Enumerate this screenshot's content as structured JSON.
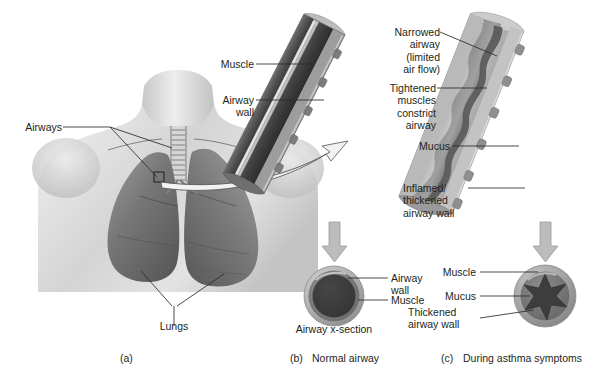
{
  "figure": {
    "title_alt": "Asthma airway anatomy figure",
    "panels": [
      {
        "key": "a",
        "letter": "(a)",
        "caption": ""
      },
      {
        "key": "b",
        "letter": "(b)",
        "caption": "Normal airway"
      },
      {
        "key": "c",
        "letter": "(c)",
        "caption": "During asthma symptoms"
      }
    ]
  },
  "panel_a": {
    "labels": {
      "airways": "Airways",
      "lungs": "Lungs"
    }
  },
  "panel_b": {
    "tube_labels": {
      "muscle": "Muscle",
      "airway_wall": "Airway\nwall"
    },
    "cross_section": {
      "caption": "Airway x-section",
      "airway_wall": "Airway\nwall",
      "muscle": "Muscle"
    }
  },
  "panel_c": {
    "tube_labels": {
      "narrowed_airway": "Narrowed\nairway\n(limited\nair flow)",
      "tightened_muscles": "Tightened\nmuscles\nconstrict\nairway",
      "mucus": "Mucus",
      "inflamed_wall": "Inflamed/\nthickened\nairway wall"
    },
    "cross_section": {
      "muscle": "Muscle",
      "mucus": "Mucus",
      "thickened_wall": "Thickened\nairway wall"
    }
  },
  "colors": {
    "ink": "#231f20",
    "leader": "#2b2b2b",
    "arrow_gray": "#b8b8b8",
    "arrow_gray_stroke": "#8e8e8e",
    "tube_outer_light": "#c9c9c9",
    "tube_mid": "#9a9a9a",
    "tube_dark": "#5d5d5d",
    "tube_darkest": "#3f3f3f",
    "lumen": "#3a3a3a",
    "skin_light": "#dcdcdc",
    "skin_mid": "#bdbdbd",
    "lung_dark": "#6e6e6e",
    "lung_mid": "#8a8a8a"
  }
}
